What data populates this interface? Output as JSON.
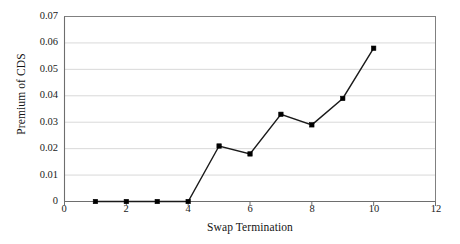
{
  "chart_data": {
    "type": "line",
    "title": "",
    "xlabel": "Swap Termination",
    "ylabel": "Premium of CDS",
    "x": [
      1,
      2,
      3,
      4,
      5,
      6,
      7,
      8,
      9,
      10
    ],
    "values": [
      0.0,
      0.0,
      0.0,
      0.0,
      0.021,
      0.018,
      0.033,
      0.029,
      0.039,
      0.058
    ],
    "series": [
      {
        "name": "Premium of CDS",
        "values": [
          0.0,
          0.0,
          0.0,
          0.0,
          0.021,
          0.018,
          0.033,
          0.029,
          0.039,
          0.058
        ]
      }
    ],
    "xlim": [
      0,
      12
    ],
    "ylim": [
      0,
      0.07
    ],
    "xticks": [
      "0",
      "2",
      "4",
      "6",
      "8",
      "10",
      "12"
    ],
    "xtick_values": [
      0,
      2,
      4,
      6,
      8,
      10,
      12
    ],
    "yticks": [
      "0",
      "0.01",
      "0.02",
      "0.03",
      "0.04",
      "0.05",
      "0.06",
      "0.07"
    ],
    "ytick_values": [
      0,
      0.01,
      0.02,
      0.03,
      0.04,
      0.05,
      0.06,
      0.07
    ],
    "grid": "horizontal",
    "legend": "none",
    "marker": "square",
    "line_color": "#1a1a1a",
    "marker_color": "#000000",
    "grid_color": "#d9d9d9",
    "axis_color": "#808080",
    "plot_background": "#ffffff"
  }
}
